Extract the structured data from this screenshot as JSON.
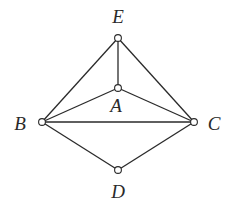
{
  "diagram": {
    "type": "graph",
    "width": 236,
    "height": 213,
    "nodes": [
      {
        "id": "A",
        "label": "A",
        "x": 118,
        "y": 88,
        "label_x": 116,
        "label_y": 112
      },
      {
        "id": "B",
        "label": "B",
        "x": 42,
        "y": 122,
        "label_x": 20,
        "label_y": 130
      },
      {
        "id": "C",
        "label": "C",
        "x": 194,
        "y": 122,
        "label_x": 214,
        "label_y": 130
      },
      {
        "id": "D",
        "label": "D",
        "x": 118,
        "y": 170,
        "label_x": 118,
        "label_y": 198
      },
      {
        "id": "E",
        "label": "E",
        "x": 118,
        "y": 38,
        "label_x": 118,
        "label_y": 23
      }
    ],
    "edges": [
      {
        "from": "E",
        "to": "B"
      },
      {
        "from": "E",
        "to": "C"
      },
      {
        "from": "E",
        "to": "A"
      },
      {
        "from": "A",
        "to": "B"
      },
      {
        "from": "A",
        "to": "C"
      },
      {
        "from": "B",
        "to": "C"
      },
      {
        "from": "B",
        "to": "D"
      },
      {
        "from": "D",
        "to": "C"
      }
    ],
    "colors": {
      "stroke": "#2a2a2a",
      "background": "#ffffff"
    }
  }
}
